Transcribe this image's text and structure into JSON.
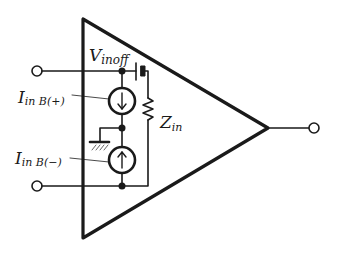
{
  "diagram": {
    "type": "op-amp input model",
    "colors": {
      "line": "#1a1a1a",
      "background": "#ffffff"
    },
    "labels": {
      "vinoff_main": "V",
      "vinoff_sub": "inoff",
      "iin_pos_main": "I",
      "iin_pos_sub": "in B(+)",
      "iin_neg_main": "I",
      "iin_neg_sub": "in B(−)",
      "zin_main": "Z",
      "zin_sub": "in"
    },
    "components": [
      {
        "name": "offset-voltage-source",
        "label": "Vinoff"
      },
      {
        "name": "bias-current-source-positive",
        "label": "Iin B(+)",
        "direction": "down"
      },
      {
        "name": "bias-current-source-negative",
        "label": "Iin B(-)",
        "direction": "up"
      },
      {
        "name": "input-impedance",
        "label": "Zin"
      },
      {
        "name": "ground"
      },
      {
        "name": "input-terminal-positive"
      },
      {
        "name": "input-terminal-negative"
      },
      {
        "name": "output-terminal"
      }
    ]
  }
}
